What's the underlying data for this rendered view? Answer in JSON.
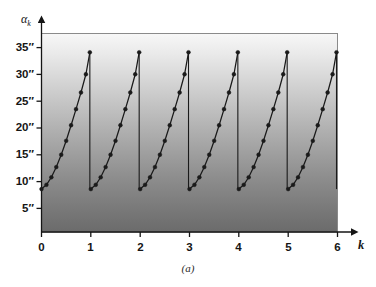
{
  "figure": {
    "caption": "(a)",
    "y_axis_symbol": "α",
    "y_axis_subscript": "k",
    "x_axis_symbol": "k"
  },
  "chart_data": {
    "type": "line",
    "title": "",
    "subtitle": "",
    "xlabel": "k",
    "ylabel": "αk",
    "xlim": [
      0,
      6
    ],
    "ylim": [
      0,
      37
    ],
    "grid": false,
    "legend": null,
    "x_ticks": [
      "0",
      "1",
      "2",
      "3",
      "4",
      "5",
      "6"
    ],
    "x_tick_values": [
      0,
      1,
      2,
      3,
      4,
      5,
      6
    ],
    "y_ticks": [
      "5″",
      "10″",
      "15″",
      "20″",
      "25″",
      "30″",
      "35″"
    ],
    "y_tick_values": [
      5,
      10,
      15,
      20,
      25,
      30,
      35
    ],
    "marker": "circle",
    "line_color": "#1a1a1a",
    "marker_color": "#1a1a1a",
    "plot_bg_gradient_top": "#f2f2f2",
    "plot_bg_gradient_bottom": "#6e6e6e",
    "period": 1,
    "ramp_min": 8.0,
    "ramp_max": 33.5,
    "cycles": 6,
    "points_per_cycle": 11,
    "series": [
      {
        "name": "alpha_k",
        "x": [
          0.0,
          0.1,
          0.2,
          0.3,
          0.4,
          0.5,
          0.6,
          0.7,
          0.8,
          0.9,
          0.98,
          1.0,
          1.1,
          1.2,
          1.3,
          1.4,
          1.5,
          1.6,
          1.7,
          1.8,
          1.9,
          1.98,
          2.0,
          2.1,
          2.2,
          2.3,
          2.4,
          2.5,
          2.6,
          2.7,
          2.8,
          2.9,
          2.98,
          3.0,
          3.1,
          3.2,
          3.3,
          3.4,
          3.5,
          3.6,
          3.7,
          3.8,
          3.9,
          3.98,
          4.0,
          4.1,
          4.2,
          4.3,
          4.4,
          4.5,
          4.6,
          4.7,
          4.8,
          4.9,
          4.98,
          5.0,
          5.1,
          5.2,
          5.3,
          5.4,
          5.5,
          5.6,
          5.7,
          5.8,
          5.9,
          5.98
        ],
        "y": [
          8.0,
          8.8,
          10.2,
          12.1,
          14.4,
          17.0,
          19.9,
          22.9,
          26.0,
          29.4,
          33.5,
          8.0,
          8.8,
          10.2,
          12.1,
          14.4,
          17.0,
          19.9,
          22.9,
          26.0,
          29.4,
          33.5,
          8.0,
          8.8,
          10.2,
          12.1,
          14.4,
          17.0,
          19.9,
          22.9,
          26.0,
          29.4,
          33.5,
          8.0,
          8.8,
          10.2,
          12.1,
          14.4,
          17.0,
          19.9,
          22.9,
          26.0,
          29.4,
          33.5,
          8.0,
          8.8,
          10.2,
          12.1,
          14.4,
          17.0,
          19.9,
          22.9,
          26.0,
          29.4,
          33.5,
          8.0,
          8.8,
          10.2,
          12.1,
          14.4,
          17.0,
          19.9,
          22.9,
          26.0,
          29.4,
          33.5
        ]
      }
    ]
  }
}
